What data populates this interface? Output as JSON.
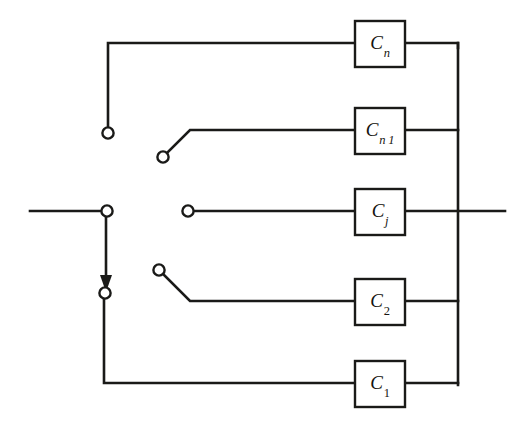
{
  "diagram": {
    "background_color": "#ffffff",
    "line_color": "#1a1a18",
    "blocks": [
      {
        "id": "block-cn",
        "label_base": "C",
        "label_sub": "n",
        "sub_style": "italic",
        "label_text": "C_n"
      },
      {
        "id": "block-cn1",
        "label_base": "C",
        "label_sub": "n-1",
        "sub_style": "italic",
        "label_text": "C_n-1"
      },
      {
        "id": "block-cj",
        "label_base": "C",
        "label_sub": "j",
        "sub_style": "italic",
        "label_text": "C_j"
      },
      {
        "id": "block-c2",
        "label_base": "C",
        "label_sub": "2",
        "sub_style": "numeric",
        "label_text": "C_2"
      },
      {
        "id": "block-c1",
        "label_base": "C",
        "label_sub": "1",
        "sub_style": "numeric",
        "label_text": "C_1"
      }
    ],
    "terminals": [
      {
        "id": "terminal-cn-contact",
        "x": 108,
        "y": 133
      },
      {
        "id": "terminal-cn1-pivot",
        "x": 163,
        "y": 157
      },
      {
        "id": "terminal-input-node",
        "x": 107,
        "y": 211
      },
      {
        "id": "terminal-cj-contact",
        "x": 188,
        "y": 211
      },
      {
        "id": "terminal-c2-pivot",
        "x": 159,
        "y": 270
      },
      {
        "id": "terminal-wiper-node",
        "x": 105,
        "y": 293
      }
    ],
    "labels": {
      "cn": "C",
      "cn_sub": "n",
      "cn1": "C",
      "cn1_sub": "n 1",
      "cn1_sub_minus": "–",
      "cj": "C",
      "cj_sub": "j",
      "c2": "C",
      "c2_sub": "2",
      "c1": "C",
      "c1_sub": "1"
    }
  }
}
